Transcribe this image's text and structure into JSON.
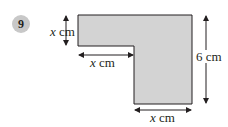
{
  "question": {
    "number": "9"
  },
  "figure": {
    "shape": "L-shaped polygon (rectangle with top-left corner removed)",
    "fill_color": "#d3d3d3",
    "stroke_color": "#231f20",
    "labels": {
      "left_height": {
        "var": "x",
        "unit": "cm"
      },
      "notch_width": {
        "var": "x",
        "unit": "cm"
      },
      "right_height": {
        "value": "6",
        "unit": "cm"
      },
      "bottom_width": {
        "var": "x",
        "unit": "cm"
      }
    }
  }
}
